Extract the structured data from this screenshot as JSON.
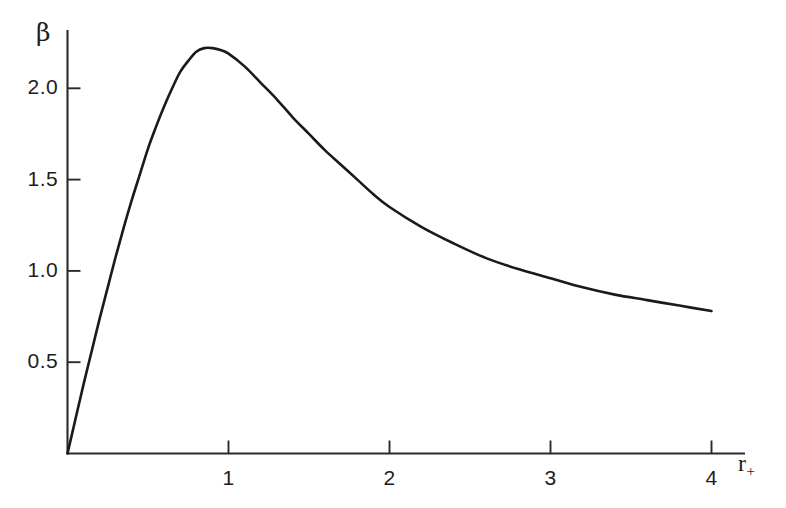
{
  "figure": {
    "background_color": "#ffffff",
    "curve_color": "#1a1a1a",
    "axis_color": "#2a2a2a"
  },
  "axes": {
    "y_title": "β",
    "x_title_base": "r",
    "x_title_sub": "+",
    "y_ticks": [
      "0.5",
      "1.0",
      "1.5",
      "2.0"
    ],
    "x_ticks": [
      "1",
      "2",
      "3",
      "4"
    ]
  },
  "chart_data": {
    "type": "line",
    "title": "",
    "xlabel": "r_+",
    "ylabel": "β",
    "xlim": [
      0,
      4.35
    ],
    "ylim": [
      0,
      2.45
    ],
    "xticks": [
      1,
      2,
      3,
      4
    ],
    "yticks": [
      0.5,
      1.0,
      1.5,
      2.0
    ],
    "grid": false,
    "legend": null,
    "series": [
      {
        "name": "beta(r_+)",
        "color": "#1a1a1a",
        "x": [
          0.0,
          0.05,
          0.1,
          0.15,
          0.2,
          0.25,
          0.3,
          0.35,
          0.4,
          0.45,
          0.5,
          0.55,
          0.6,
          0.65,
          0.7,
          0.75,
          0.8,
          0.85,
          0.9,
          0.95,
          1.0,
          1.1,
          1.2,
          1.3,
          1.4,
          1.5,
          1.6,
          1.7,
          1.8,
          1.9,
          2.0,
          2.2,
          2.4,
          2.6,
          2.8,
          3.0,
          3.2,
          3.4,
          3.6,
          3.8,
          4.0
        ],
        "y": [
          0.0,
          0.19,
          0.38,
          0.56,
          0.74,
          0.91,
          1.08,
          1.24,
          1.39,
          1.53,
          1.67,
          1.79,
          1.9,
          2.0,
          2.09,
          2.15,
          2.2,
          2.22,
          2.22,
          2.21,
          2.19,
          2.12,
          2.03,
          1.94,
          1.84,
          1.75,
          1.66,
          1.58,
          1.5,
          1.42,
          1.35,
          1.24,
          1.15,
          1.07,
          1.01,
          0.96,
          0.91,
          0.87,
          0.84,
          0.81,
          0.78
        ]
      }
    ],
    "annotations": {
      "peak_x": 0.7,
      "peak_y": 2.22,
      "end_x": 4.0,
      "end_y": 0.78
    }
  }
}
